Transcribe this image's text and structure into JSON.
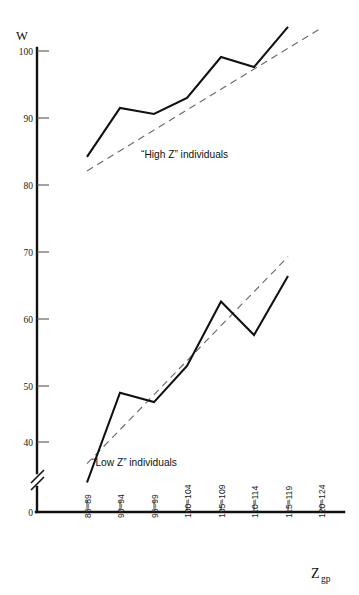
{
  "chart_data": {
    "type": "line",
    "title": "",
    "subtitle": "",
    "xlabel": "Z_gp",
    "xlabel_main": "Z",
    "xlabel_sub": "gp",
    "ylabel": "W",
    "categories": [
      "85–89",
      "90–94",
      "95–99",
      "100–104",
      "105–109",
      "110–114",
      "115–119",
      "120–124"
    ],
    "yticks": [
      40,
      50,
      60,
      70,
      80,
      90,
      100
    ],
    "ytick_labels": [
      "40",
      "50",
      "60",
      "70",
      "80",
      "90",
      "100"
    ],
    "origin_label": "0",
    "ylim": [
      40,
      103
    ],
    "y_axis_break": true,
    "y_axis_break_note": "axis break between 0 and 40",
    "grid": false,
    "legend_position": "inline-annotation",
    "series": [
      {
        "name": "“High Z” individuals",
        "label": "“High Z” individuals",
        "style": "solid",
        "categories": [
          "85–89",
          "90–94",
          "95–99",
          "100–104",
          "105–109",
          "110–114",
          "115–119",
          "120–124"
        ],
        "values": [
          84.2,
          91.5,
          90.6,
          93.0,
          99.1,
          97.6,
          103.6,
          null
        ],
        "trend": {
          "style": "dashed",
          "x_start": "85–89",
          "x_end": "120–124",
          "y_start": 82.1,
          "y_end": 103.4
        }
      },
      {
        "name": "“Low Z” individuals",
        "label": "“Low Z” individuals",
        "style": "solid",
        "categories": [
          "85–89",
          "90–94",
          "95–99",
          "100–104",
          "105–109",
          "110–114",
          "115–119",
          "120–124"
        ],
        "values": [
          35.6,
          49.0,
          47.6,
          53.0,
          62.6,
          57.6,
          66.4,
          null
        ],
        "trend": {
          "style": "dashed",
          "x_start": "85–89",
          "x_end": "115–119",
          "y_start": 38.4,
          "y_end": 69.3
        }
      }
    ],
    "annotations": [
      {
        "text": "“High Z” individuals",
        "near": "high-z-series"
      },
      {
        "text": "“Low Z” individuals",
        "near": "low-z-series"
      }
    ]
  }
}
